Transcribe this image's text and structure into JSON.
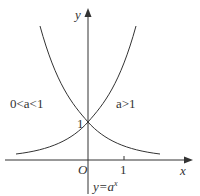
{
  "diagram": {
    "caption_prefix": "y=a",
    "caption_sup": "x",
    "axes": {
      "x_label": "x",
      "y_label": "y",
      "origin_label": "O",
      "x_tick": "1",
      "y_tick": "1"
    },
    "curves": [
      {
        "name": "decreasing",
        "label": "0<a<1"
      },
      {
        "name": "increasing",
        "label": "a>1"
      }
    ],
    "colors": {
      "stroke": "#333333",
      "text": "#333333"
    }
  }
}
